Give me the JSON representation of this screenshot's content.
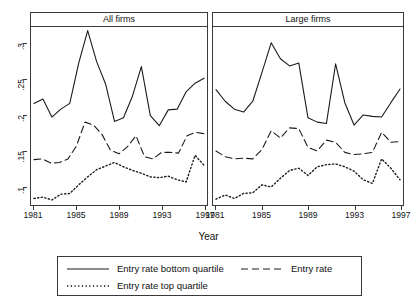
{
  "chart_data": {
    "type": "line",
    "title": "",
    "xlabel": "Year",
    "ylabel": "",
    "xlim": [
      1981,
      1997
    ],
    "ylim": [
      0.075,
      0.322
    ],
    "grid": false,
    "legend_position": "bottom",
    "x_ticks": [
      "1981",
      "1985",
      "1989",
      "1993",
      "1997"
    ],
    "x_tick_values": [
      1981,
      1985,
      1989,
      1993,
      1997
    ],
    "y_ticks": [
      ".1",
      ".15",
      ".2",
      ".25",
      ".3"
    ],
    "y_tick_values": [
      0.1,
      0.15,
      0.2,
      0.25,
      0.3
    ],
    "x": [
      1981,
      1982,
      1983,
      1984,
      1985,
      1986,
      1987,
      1988,
      1989,
      1990,
      1991,
      1992,
      1993,
      1994,
      1995,
      1996,
      1997
    ],
    "panels": [
      {
        "name": "All firms",
        "series": [
          {
            "name": "Entry rate bottom quartile",
            "style": "solid",
            "values": [
              0.216,
              0.222,
              0.197,
              0.208,
              0.216,
              0.272,
              0.317,
              0.274,
              0.243,
              0.191,
              0.196,
              0.226,
              0.267,
              0.199,
              0.185,
              0.207,
              0.208,
              0.232,
              0.244,
              0.251
            ]
          },
          {
            "name": "Entry rate",
            "style": "dashed",
            "values": [
              0.138,
              0.139,
              0.133,
              0.134,
              0.139,
              0.157,
              0.19,
              0.186,
              0.173,
              0.151,
              0.146,
              0.156,
              0.171,
              0.142,
              0.139,
              0.148,
              0.148,
              0.147,
              0.171,
              0.176,
              0.174
            ]
          },
          {
            "name": "Entry rate top quartile",
            "style": "dotted",
            "values": [
              0.084,
              0.086,
              0.082,
              0.09,
              0.091,
              0.103,
              0.114,
              0.124,
              0.129,
              0.134,
              0.128,
              0.123,
              0.119,
              0.114,
              0.113,
              0.115,
              0.11,
              0.107,
              0.144,
              0.13
            ]
          }
        ]
      },
      {
        "name": "Large firms",
        "series": [
          {
            "name": "Entry rate bottom quartile",
            "style": "solid",
            "values": [
              0.235,
              0.219,
              0.208,
              0.204,
              0.219,
              0.259,
              0.3,
              0.278,
              0.268,
              0.272,
              0.196,
              0.19,
              0.188,
              0.271,
              0.217,
              0.186,
              0.2,
              0.198,
              0.197,
              0.217,
              0.236
            ]
          },
          {
            "name": "Entry rate",
            "style": "dashed",
            "values": [
              0.15,
              0.142,
              0.139,
              0.14,
              0.139,
              0.152,
              0.178,
              0.168,
              0.182,
              0.181,
              0.155,
              0.15,
              0.165,
              0.162,
              0.148,
              0.145,
              0.146,
              0.148,
              0.176,
              0.162,
              0.163
            ]
          },
          {
            "name": "Entry rate top quartile",
            "style": "dotted",
            "values": [
              0.083,
              0.089,
              0.084,
              0.091,
              0.092,
              0.103,
              0.1,
              0.112,
              0.123,
              0.126,
              0.116,
              0.128,
              0.131,
              0.132,
              0.128,
              0.122,
              0.11,
              0.105,
              0.139,
              0.126,
              0.11
            ]
          }
        ]
      }
    ],
    "legend": [
      {
        "label": "Entry rate bottom quartile",
        "style": "solid"
      },
      {
        "label": "Entry rate",
        "style": "dashed"
      },
      {
        "label": "Entry rate top quartile",
        "style": "dotted"
      }
    ],
    "line_color": "#1a1a1a",
    "frame_color": "#3a3a3a",
    "background": "#ffffff"
  }
}
